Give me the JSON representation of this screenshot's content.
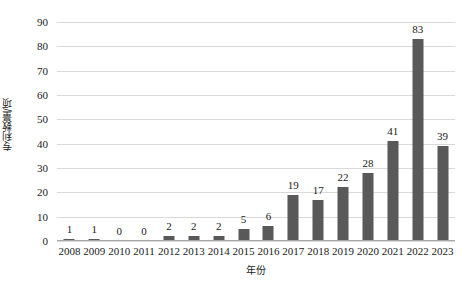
{
  "chart_data": {
    "type": "bar",
    "title": "",
    "subtitle": "",
    "xlabel": "年份",
    "ylabel": "专利数量/项",
    "categories": [
      "2008",
      "2009",
      "2010",
      "2011",
      "2012",
      "2013",
      "2014",
      "2015",
      "2016",
      "2017",
      "2018",
      "2019",
      "2020",
      "2021",
      "2022",
      "2023"
    ],
    "values": [
      1,
      1,
      0,
      0,
      2,
      2,
      2,
      5,
      6,
      19,
      17,
      22,
      28,
      41,
      83,
      39
    ],
    "data_labels": [
      "1",
      "1",
      "0",
      "0",
      "2",
      "2",
      "2",
      "5",
      "6",
      "19",
      "17",
      "22",
      "28",
      "41",
      "83",
      "39"
    ],
    "ylim": [
      0,
      90
    ],
    "ytick_values": [
      0,
      10,
      20,
      30,
      40,
      50,
      60,
      70,
      80,
      90
    ],
    "ytick_labels": [
      "0",
      "10",
      "20",
      "30",
      "40",
      "50",
      "60",
      "70",
      "80",
      "90"
    ],
    "grid": "horizontal",
    "legend": "none",
    "series": [
      {
        "name": "专利数量",
        "values": [
          1,
          1,
          0,
          0,
          2,
          2,
          2,
          5,
          6,
          19,
          17,
          22,
          28,
          41,
          83,
          39
        ]
      }
    ]
  },
  "colors": {
    "bar": "#595959",
    "gridline": "#d9d9d9",
    "axis": "#a6a6a6",
    "text": "#1a1a1a",
    "background": "#ffffff"
  }
}
